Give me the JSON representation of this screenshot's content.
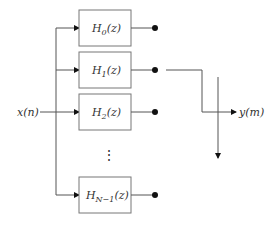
{
  "diagram": {
    "type": "polyphase-filter-bank-commutator",
    "input_label": "x(n)",
    "output_label": "y(m)",
    "ellipsis": "⋮",
    "filters": [
      {
        "name": "H",
        "sub": "0",
        "arg": "(z)"
      },
      {
        "name": "H",
        "sub": "1",
        "arg": "(z)"
      },
      {
        "name": "H",
        "sub": "2",
        "arg": "(z)"
      },
      {
        "name": "H",
        "sub": "N−1",
        "arg": "(z)"
      }
    ],
    "colors": {
      "line": "#555555",
      "box": "#777777",
      "text": "#333333",
      "dot": "#111111"
    }
  }
}
